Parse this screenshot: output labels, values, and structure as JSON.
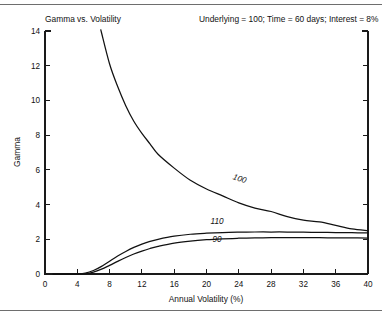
{
  "figure": {
    "title": "Gamma vs. Volatility",
    "parameters_text": "Underlying = 100;  Time = 60 days;  Interest = 8%",
    "rule_color": "#6e6e6e",
    "line_color": "#111111"
  },
  "chart_data": {
    "type": "line",
    "title": "Gamma vs. Volatility",
    "subtitle": "Underlying = 100;  Time = 60 days;  Interest = 8%",
    "xlabel": "Annual Volatility (%)",
    "ylabel": "Gamma",
    "xlim": [
      0,
      40
    ],
    "ylim": [
      0,
      14
    ],
    "xticks": [
      0,
      4,
      8,
      12,
      16,
      20,
      24,
      28,
      32,
      36,
      40
    ],
    "yticks": [
      0,
      2,
      4,
      6,
      8,
      10,
      12,
      14
    ],
    "grid": false,
    "legend": "inline-curve-labels",
    "x": [
      1,
      2,
      3,
      4,
      5,
      6,
      7,
      8,
      9,
      10,
      11,
      12,
      13,
      14,
      16,
      18,
      20,
      22,
      24,
      26,
      28,
      30,
      32,
      34,
      36,
      38,
      40
    ],
    "series": [
      {
        "name": "100",
        "label": "100",
        "label_x": 24.0,
        "label_y": 5.35,
        "label_rotation": 19,
        "values": [
          97.0,
          48.5,
          32.3,
          24.2,
          19.4,
          16.2,
          13.9,
          12.1,
          10.8,
          9.7,
          8.8,
          8.1,
          7.5,
          6.9,
          6.1,
          5.4,
          4.9,
          4.5,
          4.1,
          3.8,
          3.6,
          3.3,
          3.1,
          3.0,
          2.8,
          2.6,
          2.5
        ]
      },
      {
        "name": "110",
        "label": "110",
        "label_x": 21.3,
        "label_y": 2.86,
        "label_rotation": 0,
        "values": [
          0.0,
          0.0,
          0.0,
          0.004,
          0.05,
          0.2,
          0.44,
          0.74,
          1.04,
          1.3,
          1.53,
          1.72,
          1.88,
          2.0,
          2.18,
          2.29,
          2.35,
          2.39,
          2.41,
          2.42,
          2.42,
          2.42,
          2.41,
          2.4,
          2.39,
          2.38,
          2.37
        ]
      },
      {
        "name": "90",
        "label": "90",
        "label_x": 21.3,
        "label_y": 1.82,
        "label_rotation": 0,
        "values": [
          0.0,
          0.0,
          0.0,
          0.0,
          0.02,
          0.11,
          0.28,
          0.5,
          0.73,
          0.95,
          1.15,
          1.32,
          1.47,
          1.59,
          1.78,
          1.9,
          1.98,
          2.03,
          2.06,
          2.08,
          2.09,
          2.09,
          2.09,
          2.09,
          2.08,
          2.08,
          2.07
        ]
      }
    ]
  }
}
